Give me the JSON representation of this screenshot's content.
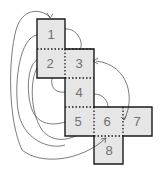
{
  "diagram": {
    "type": "cube-net-folding",
    "colors": {
      "face_fill": "#e6e6e6",
      "outline": "#1a1a1a",
      "label": "#707070",
      "connector": "#444444"
    },
    "faces": [
      {
        "id": "1",
        "label": "1"
      },
      {
        "id": "2",
        "label": "2"
      },
      {
        "id": "3",
        "label": "3"
      },
      {
        "id": "4",
        "label": "4"
      },
      {
        "id": "5",
        "label": "5"
      },
      {
        "id": "6",
        "label": "6"
      },
      {
        "id": "7",
        "label": "7"
      },
      {
        "id": "8",
        "label": "8"
      }
    ],
    "connections": [
      {
        "from": "2",
        "to": "1",
        "arrow": true
      },
      {
        "from": "5",
        "to": "8",
        "arrow": true
      },
      {
        "from": "3",
        "to": "6",
        "arrow": true
      },
      {
        "from": "1",
        "to": "3",
        "arrow": false
      },
      {
        "from": "2",
        "to": "4",
        "arrow": false
      },
      {
        "from": "4",
        "to": "6",
        "arrow": false
      },
      {
        "from": "2",
        "to": "5",
        "arrow": false
      },
      {
        "from": "1",
        "to": "5",
        "arrow": false
      }
    ]
  }
}
